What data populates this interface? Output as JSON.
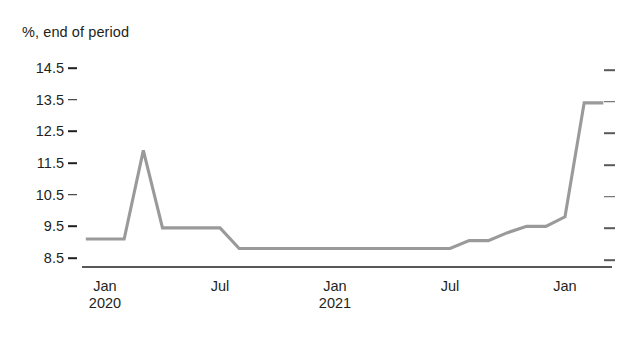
{
  "chart_data": {
    "type": "line",
    "title": "",
    "ylabel": "%, end of period",
    "xlabel": "",
    "ylim": [
      8.5,
      14.5
    ],
    "yticks": [
      8.5,
      9.5,
      10.5,
      11.5,
      12.5,
      13.5,
      14.5
    ],
    "ytick_labels": [
      "8.5",
      "9.5",
      "10.5",
      "11.5",
      "12.5",
      "13.5",
      "14.5"
    ],
    "grid": false,
    "legend": null,
    "line_color": "#9a9a9a",
    "axis_color": "#231f20",
    "xticks": [
      {
        "label": "Jan",
        "sublabel": "2020",
        "x": 0
      },
      {
        "label": "Jul",
        "sublabel": "",
        "x": 6
      },
      {
        "label": "Jan",
        "sublabel": "2021",
        "x": 12
      },
      {
        "label": "Jul",
        "sublabel": "",
        "x": 18
      },
      {
        "label": "Jan",
        "sublabel": "",
        "x": 24
      }
    ],
    "xlim": [
      -1,
      26
    ],
    "x": [
      -1,
      0,
      1,
      2,
      3,
      4,
      5,
      6,
      7,
      8,
      9,
      10,
      11,
      12,
      13,
      14,
      15,
      16,
      17,
      18,
      19,
      20,
      21,
      22,
      23,
      24,
      25,
      26
    ],
    "x_labels": [
      "Dec 2019",
      "Jan 2020",
      "Feb 2020",
      "Mar 2020",
      "Apr 2020",
      "May 2020",
      "Jun 2020",
      "Jul 2020",
      "Aug 2020",
      "Sep 2020",
      "Oct 2020",
      "Nov 2020",
      "Dec 2020",
      "Jan 2021",
      "Feb 2021",
      "Mar 2021",
      "Apr 2021",
      "May 2021",
      "Jun 2021",
      "Jul 2021",
      "Aug 2021",
      "Sep 2021",
      "Oct 2021",
      "Nov 2021",
      "Dec 2021",
      "Jan 2022",
      "Feb 2022",
      "Mar 2022"
    ],
    "values": [
      9.1,
      9.1,
      9.1,
      11.9,
      9.45,
      9.45,
      9.45,
      9.45,
      8.8,
      8.8,
      8.8,
      8.8,
      8.8,
      8.8,
      8.8,
      8.8,
      8.8,
      8.8,
      8.8,
      8.8,
      9.05,
      9.05,
      9.3,
      9.5,
      9.5,
      9.8,
      13.4,
      13.4
    ]
  }
}
